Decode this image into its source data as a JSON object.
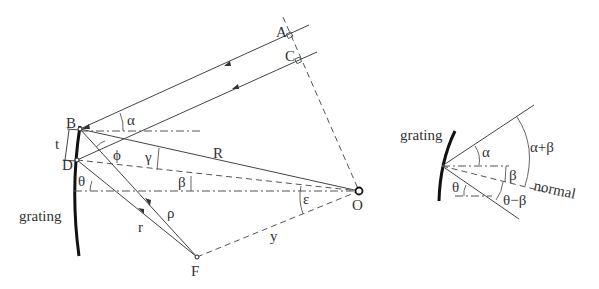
{
  "diagram": {
    "left_panel": {
      "points": {
        "A": "A",
        "B": "B",
        "C": "C",
        "D": "D",
        "F": "F",
        "O": "O"
      },
      "labels": {
        "grating": "grating",
        "t": "t",
        "R": "R",
        "r": "r",
        "rho": "ρ",
        "y": "y",
        "alpha": "α",
        "phi": "ϕ",
        "gamma": "γ",
        "beta": "β",
        "theta": "θ",
        "epsilon": "ε"
      }
    },
    "right_panel": {
      "labels": {
        "grating": "grating",
        "alpha": "α",
        "alpha_plus_beta": "α+β",
        "beta": "β",
        "normal": "normal",
        "theta": "θ",
        "theta_minus_beta": "θ−β"
      }
    },
    "colors": {
      "line": "#444444",
      "grating": "#111111",
      "text": "#333333"
    }
  }
}
